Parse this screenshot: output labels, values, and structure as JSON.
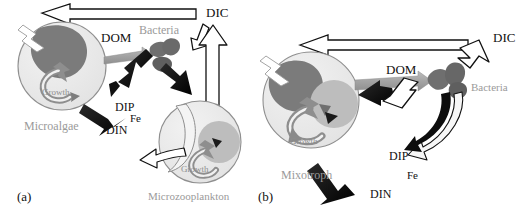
{
  "figure": {
    "type": "scientific-schematic",
    "background_color": "#ffffff",
    "colors": {
      "cell_body": "#e9e9e9",
      "cell_outline": "#8c8c8c",
      "chloroplast": "#7b7b7b",
      "food_vacuole": "#b9b9b9",
      "bacteria": "#6f6f6f",
      "black_arrow": "#111111",
      "gray_arrow": "#a6a6a6",
      "hollow_arrow_fill": "#ffffff",
      "hollow_arrow_stroke": "#111111",
      "gray_text": "#9a9a9a",
      "black_text": "#111111"
    }
  },
  "panels": [
    {
      "id": "a",
      "tag": "(a)",
      "organisms": [
        {
          "name": "Microalgae",
          "label": "Microalgae",
          "label_color": "gray",
          "sublabel": "Growth"
        },
        {
          "name": "Microzooplankton",
          "label": "Microzooplankton",
          "label_color": "gray",
          "sublabel": "Growth"
        },
        {
          "name": "Bacteria",
          "label": "Bacteria",
          "label_color": "gray"
        }
      ],
      "flow_labels": [
        {
          "text": "DOM",
          "color": "black"
        },
        {
          "text": "DIC",
          "color": "black"
        },
        {
          "text": "DIP",
          "color": "black"
        },
        {
          "text": "Fe",
          "color": "black"
        },
        {
          "text": "DIN",
          "color": "black"
        }
      ],
      "growth_labels": [
        "Growth",
        "Growth"
      ]
    },
    {
      "id": "b",
      "tag": "(b)",
      "organisms": [
        {
          "name": "Mixotroph",
          "label": "Mixotroph",
          "label_color": "gray",
          "sublabel": "Growth"
        },
        {
          "name": "Bacteria",
          "label": "Bacteria",
          "label_color": "gray"
        }
      ],
      "flow_labels": [
        {
          "text": "DOM",
          "color": "black"
        },
        {
          "text": "DIC",
          "color": "black"
        },
        {
          "text": "DIP",
          "color": "black"
        },
        {
          "text": "Fe",
          "color": "black"
        },
        {
          "text": "DIN",
          "color": "black"
        }
      ],
      "growth_labels": [
        "Growth"
      ]
    }
  ],
  "labels": {
    "a": {
      "tag": "(a)",
      "microalgae": "Microalgae",
      "growth_algae": "Growth",
      "bacteria": "Bacteria",
      "dom": "DOM",
      "dic": "DIC",
      "dip": "DIP",
      "fe": "Fe",
      "din": "DIN",
      "microzooplankton": "Microzooplankton",
      "growth_zoo": "Growth"
    },
    "b": {
      "tag": "(b)",
      "mixotroph": "Mixotroph",
      "growth_mixo": "Growth",
      "bacteria": "Bacteria",
      "dom": "DOM",
      "dic": "DIC",
      "dip": "DIP",
      "fe": "Fe",
      "din": "DIN"
    }
  }
}
